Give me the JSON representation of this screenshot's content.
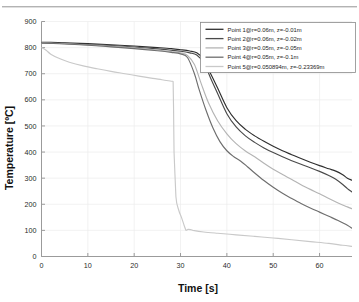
{
  "figure": {
    "background_color": "#ffffff",
    "axis_color": "#9b9b9b",
    "grid_color": "#ededed",
    "scan_artifact": true
  },
  "axes": {
    "x_title": "Time [s]",
    "y_title": "Temperature [ºC]",
    "x_ticks": [
      "0",
      "10",
      "20",
      "30",
      "40",
      "50",
      "60"
    ],
    "y_ticks": [
      "0",
      "100",
      "200",
      "300",
      "400",
      "500",
      "600",
      "700",
      "800",
      "900"
    ]
  },
  "legend": {
    "position": "top-right",
    "border_color": "#8a8a8a",
    "background": "#ffffff",
    "entries": [
      {
        "label": "Point  1@r=0.06m,  z=-0.01m",
        "color": "#2f2f2f"
      },
      {
        "label": "Point  2@r=0.06m,  z=-0.02m",
        "color": "#4a4a4a"
      },
      {
        "label": "Point  3@r=0.05m,  z=-0.05m",
        "color": "#b4b4b4"
      },
      {
        "label": "Point  4@r=0.05m,  z=-0.1m",
        "color": "#6e6e6e"
      },
      {
        "label": "Point  5@r=0.050894m,  z=-0.23369m",
        "color": "#c9c9c9"
      }
    ]
  },
  "chart_data": {
    "type": "line",
    "title": "",
    "xlabel": "Time [s]",
    "ylabel": "Temperature [ºC]",
    "xlim": [
      0,
      67
    ],
    "ylim": [
      0,
      900
    ],
    "xticks": [
      0,
      10,
      20,
      30,
      40,
      50,
      60
    ],
    "yticks": [
      0,
      100,
      200,
      300,
      400,
      500,
      600,
      700,
      800,
      900
    ],
    "grid": true,
    "legend_position": "top right",
    "series": [
      {
        "name": "Point  1@r=0.06m,  z=-0.01m",
        "color": "#2f2f2f",
        "x": [
          0,
          2,
          5,
          10,
          15,
          20,
          25,
          28,
          30,
          32,
          33.5,
          35,
          36.5,
          38,
          40,
          42,
          44,
          46,
          48,
          50,
          52,
          54,
          56,
          58,
          60,
          62,
          63.5,
          65,
          66,
          67
        ],
        "y": [
          820,
          820,
          818,
          815,
          811,
          806,
          800,
          796,
          792,
          787,
          780,
          755,
          700,
          645,
          570,
          520,
          487,
          462,
          441,
          422,
          405,
          390,
          375,
          361,
          348,
          336,
          327,
          313,
          300,
          292
        ]
      },
      {
        "name": "Point  2@r=0.06m,  z=-0.02m",
        "color": "#4a4a4a",
        "x": [
          0,
          2,
          5,
          10,
          15,
          20,
          25,
          28,
          30,
          32,
          33.5,
          35,
          36.5,
          38,
          40,
          42,
          44,
          46,
          48,
          50,
          52,
          54,
          56,
          58,
          60,
          62,
          63.5,
          65,
          66,
          67
        ],
        "y": [
          819,
          818,
          816,
          812,
          808,
          802,
          795,
          790,
          786,
          780,
          772,
          742,
          683,
          624,
          547,
          496,
          462,
          437,
          416,
          398,
          382,
          367,
          353,
          340,
          326,
          310,
          296,
          276,
          260,
          247
        ]
      },
      {
        "name": "Point  3@r=0.05m,  z=-0.05m",
        "color": "#b4b4b4",
        "x": [
          0,
          2,
          5,
          10,
          15,
          20,
          25,
          28,
          30,
          31.5,
          33,
          34.5,
          36,
          38,
          40,
          42,
          44,
          46,
          48,
          50,
          52,
          54,
          56,
          58,
          60,
          62,
          64,
          66,
          67
        ],
        "y": [
          818,
          817,
          815,
          810,
          805,
          799,
          791,
          785,
          780,
          770,
          735,
          660,
          590,
          520,
          470,
          432,
          404,
          382,
          357,
          334,
          314,
          295,
          275,
          257,
          240,
          222,
          205,
          190,
          183
        ]
      },
      {
        "name": "Point  4@r=0.05m,  z=-0.1m",
        "color": "#6e6e6e",
        "x": [
          0,
          2,
          5,
          10,
          15,
          20,
          25,
          28,
          30,
          31.5,
          33,
          34,
          35.5,
          37,
          38.5,
          40,
          41.5,
          43,
          44.5,
          46,
          48,
          50,
          52,
          54,
          56,
          58,
          60,
          62,
          64,
          66,
          67
        ],
        "y": [
          817,
          816,
          814,
          809,
          803,
          796,
          788,
          782,
          776,
          762,
          700,
          640,
          560,
          492,
          440,
          405,
          382,
          365,
          343,
          320,
          291,
          265,
          242,
          222,
          203,
          186,
          170,
          154,
          138,
          120,
          108
        ]
      },
      {
        "name": "Point  5@r=0.050894m,  z=-0.23369m",
        "color": "#c9c9c9",
        "x": [
          0,
          1,
          2,
          4,
          6,
          9,
          12,
          15,
          18,
          21,
          24,
          26,
          28,
          28.4,
          28.5,
          28.6,
          29,
          29.6,
          30.2,
          30.8,
          31.2,
          31.6,
          32.2,
          33,
          35,
          38,
          42,
          46,
          50,
          54,
          58,
          62,
          65,
          67
        ],
        "y": [
          800,
          790,
          775,
          757,
          744,
          730,
          719,
          709,
          700,
          691,
          682,
          677,
          671,
          670,
          560,
          400,
          230,
          178,
          150,
          118,
          100,
          104,
          103,
          99,
          94,
          89,
          83,
          77,
          71,
          64,
          57,
          50,
          43,
          39
        ]
      }
    ]
  }
}
